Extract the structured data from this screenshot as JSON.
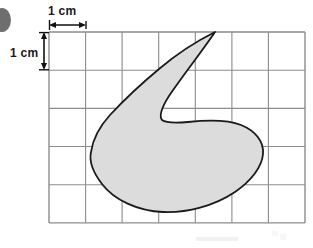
{
  "figure": {
    "kind": "grid-area-estimation-diagram",
    "background_color": "#ffffff"
  },
  "grid": {
    "columns": 7,
    "rows": 5,
    "cell_size_cm": 1,
    "origin_x": 49,
    "origin_y": 32,
    "cell_px": 36.57,
    "line_color": "#8c8c8c",
    "line_width": 1.1,
    "border_color": "#8c8c8c"
  },
  "scale_labels": {
    "horizontal": {
      "text": "1 cm",
      "arrow_color": "#111111",
      "spans_cells": 1
    },
    "vertical": {
      "text": "1 cm",
      "arrow_color": "#111111",
      "spans_cells": 1
    }
  },
  "shape": {
    "name": "irregular-blob",
    "fill_color": "#dcdcdc",
    "stroke_color": "#1a1a1a",
    "stroke_width": 1.8,
    "key_points": {
      "spike_tip": [
        215,
        32
      ],
      "notch_bottom": [
        175,
        122
      ],
      "leftmost": [
        91,
        155
      ],
      "rightmost": [
        263,
        152
      ],
      "bottommost": [
        163,
        212
      ]
    },
    "path": "M 215 32 C 200 54 176 82 166 100 C 160 111 160 117 162 121 C 166 123 176 123 186 122 C 205 120 225 119 240 124 C 256 130 264 141 263 153 C 262 166 252 180 236 191 C 215 205 187 213 163 212 C 138 211 115 200 103 184 C 93 171 90 162 91 153 C 92 139 98 127 108 116 C 122 101 140 85 158 70 C 178 54 200 40 215 32 Z"
  },
  "decorations": {
    "corner_dot": {
      "name": "page-corner-dot",
      "color": "#6e6e6e",
      "cx": 2,
      "cy": 20,
      "rx": 9,
      "ry": 12
    },
    "footer_smudges": [
      {
        "x": 196,
        "y": 238,
        "width": 42,
        "height": 4,
        "color": "#f1f1f1"
      },
      {
        "x": 272,
        "y": 231,
        "width": 14,
        "height": 10,
        "color": "#f6f6f6"
      }
    ]
  }
}
